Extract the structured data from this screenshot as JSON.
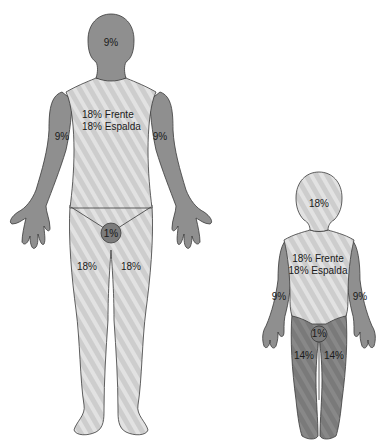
{
  "colors": {
    "dark_region": "#8f8f8f",
    "light_region": "#cfcfcf",
    "stripe": "#e4e4e4",
    "perineum": "#7c7c7c",
    "child_legs": "#7d7d7d",
    "outline": "#3a3a3a",
    "text": "#1a1a1a"
  },
  "adult": {
    "head": "9%",
    "torso_front": "18% Frente",
    "torso_back": "18% Espalda",
    "arm_left": "9%",
    "arm_right": "9%",
    "perineum": "1%",
    "leg_left": "18%",
    "leg_right": "18%"
  },
  "child": {
    "head": "18%",
    "torso_front": "18% Frente",
    "torso_back": "18% Espalda",
    "arm_left": "9%",
    "arm_right": "9%",
    "perineum": "1%",
    "leg_left": "14%",
    "leg_right": "14%"
  }
}
